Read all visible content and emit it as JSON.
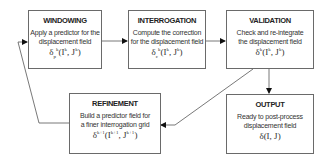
{
  "diagram": {
    "nodes": [
      {
        "id": "windowing",
        "title": "WINDOWING",
        "desc1": "Apply a predictor for the",
        "desc2": "displacement field",
        "formula_base": "δ",
        "formula_sub": "p",
        "formula_sup": "k",
        "formula_args": "(I",
        "formula_arg_sup1": "k",
        "formula_mid": ", J",
        "formula_arg_sup2": "k",
        "formula_end": ")"
      },
      {
        "id": "interrogation",
        "title": "INTERROGATION",
        "desc1": "Compute the correction",
        "desc2": "for the displacement field",
        "formula_base": "δ",
        "formula_sub": "c",
        "formula_sup": "k",
        "formula_args": "(I",
        "formula_arg_sup1": "k",
        "formula_mid": ", J",
        "formula_arg_sup2": "k",
        "formula_end": ")"
      },
      {
        "id": "validation",
        "title": "VALIDATION",
        "desc1": "Check and re-integrate",
        "desc2": "the displacement field",
        "formula_base": "δ",
        "formula_sub": "",
        "formula_sup": "k",
        "formula_args": "(I",
        "formula_arg_sup1": "k",
        "formula_mid": ", J",
        "formula_arg_sup2": "k",
        "formula_end": ")"
      },
      {
        "id": "refinement",
        "title": "REFINEMENT",
        "desc1": "Build a predictor field for",
        "desc2": "a finer interrogation grid",
        "formula_base": "δ",
        "formula_sub": "",
        "formula_sup": "k+1",
        "formula_args": "(I",
        "formula_arg_sup1": "k+1",
        "formula_mid": ", J",
        "formula_arg_sup2": "k+1",
        "formula_end": ")"
      },
      {
        "id": "output",
        "title": "OUTPUT",
        "desc1": "Ready to post-process",
        "desc2": "displacement field",
        "formula_base": "δ",
        "formula_sub": "",
        "formula_sup": "",
        "formula_args": "(I, J",
        "formula_arg_sup1": "",
        "formula_mid": "",
        "formula_arg_sup2": "",
        "formula_end": ")"
      }
    ],
    "edges": [
      {
        "from": "windowing",
        "to": "interrogation"
      },
      {
        "from": "interrogation",
        "to": "validation"
      },
      {
        "from": "validation",
        "to": "output"
      },
      {
        "from": "validation",
        "to": "refinement"
      },
      {
        "from": "refinement",
        "to": "windowing"
      }
    ],
    "colors": {
      "stroke": "#6a6a6a",
      "arrow": "#111111",
      "text": "#222222"
    }
  }
}
